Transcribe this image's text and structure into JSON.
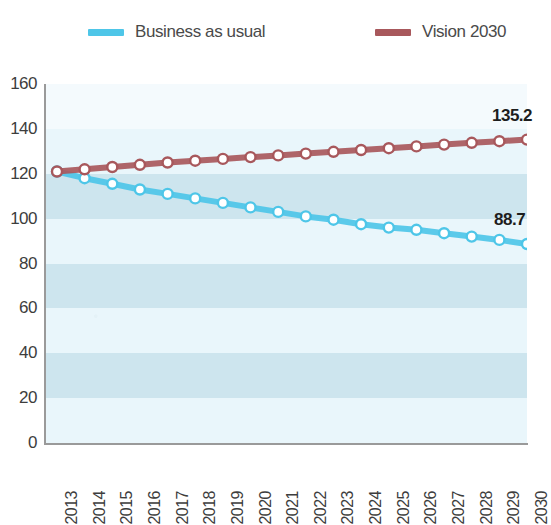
{
  "legend": {
    "position": "top",
    "items": [
      {
        "label": "Business as usual",
        "color": "#4ec6e8",
        "icon": "line-swatch-icon"
      },
      {
        "label": "Vision 2030",
        "color": "#a8585c",
        "icon": "line-swatch-icon"
      }
    ]
  },
  "axes": {
    "y_ticks": [
      "160",
      "140",
      "120",
      "100",
      "80",
      "60",
      "40",
      "20",
      "0"
    ],
    "x_ticks": [
      "2013",
      "2014",
      "2015",
      "2016",
      "2017",
      "2018",
      "2019",
      "2020",
      "2021",
      "2022",
      "2023",
      "2024",
      "2025",
      "2026",
      "2027",
      "2028",
      "2029",
      "2030"
    ]
  },
  "annotations": {
    "vision_end_label": "135.2",
    "bau_end_label": "88.7"
  },
  "colors": {
    "bau": "#4ec6e8",
    "vision": "#a8585c",
    "band_light": "#e9f6fb",
    "band_dark": "#cde5ee",
    "marker_fill": "#ffffff",
    "axis": "#9a9a9a",
    "text": "#3d3d3d"
  },
  "chart_data": {
    "type": "line",
    "title": "",
    "xlabel": "",
    "ylabel": "",
    "ylim": [
      0,
      160
    ],
    "ytick_step": 20,
    "grid": "horizontal-bands",
    "legend_position": "top",
    "categories": [
      "2013",
      "2014",
      "2015",
      "2016",
      "2017",
      "2018",
      "2019",
      "2020",
      "2021",
      "2022",
      "2023",
      "2024",
      "2025",
      "2026",
      "2027",
      "2028",
      "2029",
      "2030"
    ],
    "series": [
      {
        "name": "Business as usual",
        "color": "#4ec6e8",
        "marker": "circle-open",
        "values": [
          121.0,
          118.0,
          115.5,
          113.0,
          111.0,
          109.0,
          107.0,
          105.0,
          103.0,
          101.0,
          99.5,
          97.5,
          96.0,
          95.0,
          93.5,
          92.0,
          90.5,
          88.7
        ],
        "end_label": "88.7"
      },
      {
        "name": "Vision 2030",
        "color": "#a8585c",
        "marker": "circle-open",
        "values": [
          121.0,
          122.0,
          123.0,
          124.0,
          125.0,
          125.8,
          126.6,
          127.4,
          128.2,
          129.0,
          129.8,
          130.6,
          131.4,
          132.2,
          133.0,
          133.8,
          134.5,
          135.2
        ],
        "end_label": "135.2"
      }
    ]
  }
}
